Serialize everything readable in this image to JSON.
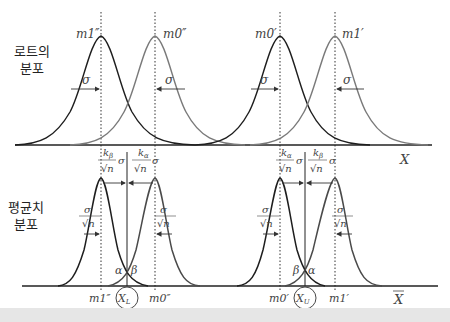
{
  "labels": {
    "lot_distribution": [
      "로트의",
      "분포"
    ],
    "mean_distribution": [
      "평균치",
      "분포"
    ]
  },
  "top_panel": {
    "axis_label": "X",
    "peaks": [
      {
        "label": "m1″",
        "color": "#222222"
      },
      {
        "label": "m0″",
        "color": "#777777"
      },
      {
        "label": "m0′",
        "color": "#222222"
      },
      {
        "label": "m1′",
        "color": "#777777"
      }
    ],
    "sigma_label": "σ",
    "k_labels": [
      "kβ",
      "kα",
      "kα",
      "kβ"
    ]
  },
  "bottom_panel": {
    "axis_label": "X̄",
    "left_limit_label": "X_L",
    "right_limit_label": "X_U",
    "left_tail_labels": [
      "α",
      "β"
    ],
    "right_tail_labels": [
      "β",
      "α"
    ],
    "sigma_over_root_n": "σ/√n",
    "k_beta_term": "kβ/√n σ",
    "k_alpha_term": "kα/√n σ",
    "x_labels": [
      "m1″",
      "m0″",
      "m0′",
      "m1′"
    ]
  },
  "colors": {
    "dark_curve": "#1e1e1e",
    "light_curve": "#7a7a7a",
    "axis": "#222222",
    "strip": "#e6e6e6"
  }
}
